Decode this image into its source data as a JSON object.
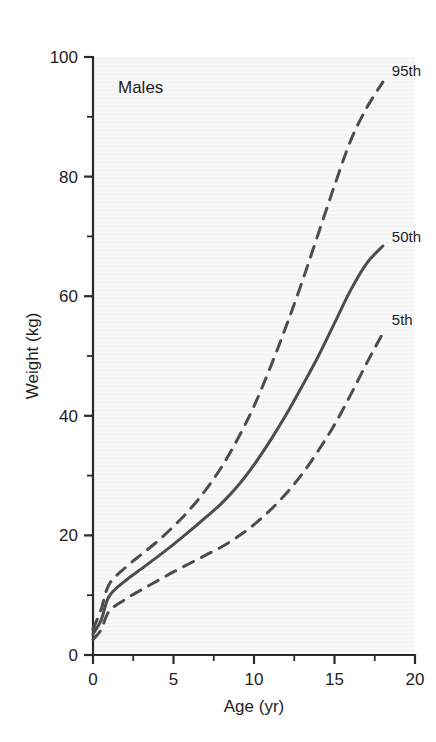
{
  "chart_data": {
    "type": "line",
    "title": "",
    "panel_label": "Males",
    "xlabel": "Age (yr)",
    "ylabel": "Weight (kg)",
    "xlim": [
      0,
      20
    ],
    "ylim": [
      0,
      100
    ],
    "grid": false,
    "legend_position": "inline-right-end-of-curve",
    "x_ticks": [
      0,
      5,
      10,
      15,
      20
    ],
    "x_tick_labels": [
      "0",
      "5",
      "10",
      "15",
      "20"
    ],
    "x_minor_ticks": [
      2.5,
      7.5,
      12.5,
      17.5
    ],
    "y_ticks": [
      0,
      20,
      40,
      60,
      80,
      100
    ],
    "y_tick_labels": [
      "0",
      "20",
      "40",
      "60",
      "80",
      "100"
    ],
    "y_minor_ticks": [
      10,
      30,
      50,
      70,
      90
    ],
    "x": [
      0,
      0.5,
      1,
      2,
      3,
      4,
      5,
      6,
      7,
      8,
      9,
      10,
      11,
      12,
      13,
      14,
      15,
      16,
      17,
      18
    ],
    "series": [
      {
        "name": "95th",
        "label": "95th",
        "style": "dashed",
        "color": "#4d4d4d",
        "values": [
          4.3,
          7.6,
          11.8,
          14.6,
          16.8,
          19.0,
          21.5,
          24.3,
          27.6,
          31.5,
          36.2,
          41.6,
          48.0,
          55.0,
          62.5,
          70.5,
          78.5,
          86.0,
          91.5,
          95.8
        ]
      },
      {
        "name": "50th",
        "label": "50th",
        "style": "solid",
        "color": "#4d4d4d",
        "values": [
          3.5,
          5.8,
          9.8,
          12.4,
          14.4,
          16.4,
          18.5,
          20.7,
          23.0,
          25.4,
          28.3,
          31.8,
          35.8,
          40.2,
          45.0,
          50.0,
          55.5,
          61.0,
          65.5,
          68.4
        ]
      },
      {
        "name": "5th",
        "label": "5th",
        "style": "dashed",
        "color": "#4d4d4d",
        "values": [
          2.6,
          4.2,
          7.3,
          9.3,
          10.9,
          12.4,
          13.9,
          15.3,
          16.7,
          18.1,
          19.8,
          21.8,
          24.2,
          27.0,
          30.3,
          34.2,
          38.5,
          43.5,
          48.8,
          53.8
        ]
      }
    ]
  },
  "style": {
    "plot_background": "#f4f4f4",
    "axis_color": "#2a2a2a",
    "curve_color": "#4d4d4d",
    "text_color": "#1e1e1e"
  }
}
